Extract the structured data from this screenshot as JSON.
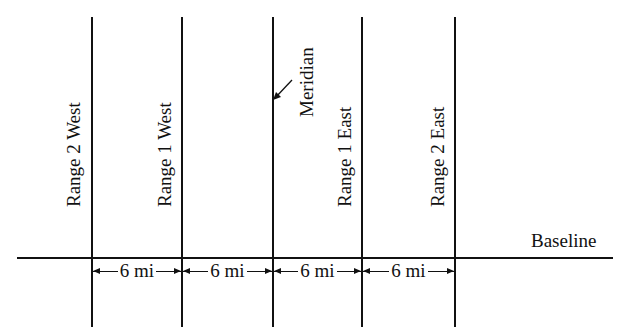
{
  "diagram": {
    "lines": [
      {
        "name": "range-2-west-line",
        "label": "Range 2 West"
      },
      {
        "name": "range-1-west-line",
        "label": "Range 1 West"
      },
      {
        "name": "meridian-line",
        "label": "Meridian"
      },
      {
        "name": "range-1-east-line",
        "label": "Range 1 East"
      },
      {
        "name": "range-2-east-line",
        "label": "Range 2 East"
      }
    ],
    "baseline_label": "Baseline",
    "spacings": [
      "6 mi",
      "6 mi",
      "6 mi",
      "6 mi"
    ],
    "line_color": "#111111"
  }
}
